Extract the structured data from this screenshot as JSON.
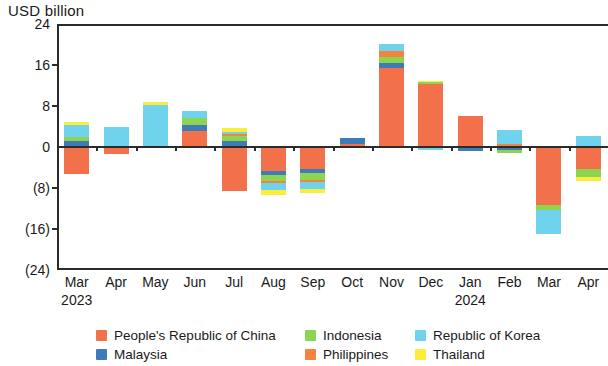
{
  "chart_data": {
    "type": "bar",
    "stacked": true,
    "title": "",
    "subtitle": "",
    "xlabel": "",
    "ylabel": "USD billion",
    "ylim": [
      -24,
      24
    ],
    "yticks": [
      24,
      16,
      8,
      0,
      -8,
      -16,
      -24
    ],
    "ytick_labels": [
      "24",
      "16",
      "8",
      "0",
      "(8)",
      "(16)",
      "(24)"
    ],
    "grid": false,
    "legend_position": "bottom",
    "categories": [
      "Mar",
      "Apr",
      "May",
      "Jun",
      "Jul",
      "Aug",
      "Sep",
      "Oct",
      "Nov",
      "Dec",
      "Jan",
      "Feb",
      "Mar",
      "Apr"
    ],
    "year_labels": [
      {
        "text": "2023",
        "category_index": 0
      },
      {
        "text": "2024",
        "category_index": 10
      }
    ],
    "series": [
      {
        "name": "People's Republic of China",
        "color": "#F2714A",
        "values": [
          -5.2,
          -1.4,
          0.0,
          3.2,
          -8.6,
          -4.6,
          -4.2,
          0.6,
          15.4,
          12.2,
          6.0,
          0.0,
          -11.3,
          -4.2
        ]
      },
      {
        "name": "Malaysia",
        "color": "#3F7CB5",
        "values": [
          1.1,
          0.0,
          0.0,
          1.0,
          1.2,
          -0.9,
          -0.9,
          1.2,
          1.0,
          0.0,
          -0.7,
          -0.5,
          0.0,
          0.0
        ]
      },
      {
        "name": "Indonesia",
        "color": "#8DD450",
        "values": [
          0.9,
          0.0,
          0.0,
          1.4,
          1.0,
          -1.1,
          -1.3,
          0.0,
          1.2,
          0.4,
          0.0,
          -0.7,
          -1.0,
          -1.6
        ]
      },
      {
        "name": "Philippines",
        "color": "#F5823F",
        "values": [
          0.0,
          0.0,
          0.0,
          0.0,
          0.3,
          -0.4,
          -0.4,
          0.0,
          1.1,
          0.0,
          0.0,
          0.5,
          0.0,
          0.0
        ]
      },
      {
        "name": "Republic of Korea",
        "color": "#6FD3EE",
        "values": [
          2.3,
          3.9,
          8.2,
          1.5,
          0.5,
          -1.4,
          -1.4,
          0.0,
          1.4,
          -0.5,
          0.0,
          2.8,
          -4.7,
          2.2
        ]
      },
      {
        "name": "Thailand",
        "color": "#FBEE3B",
        "values": [
          0.6,
          0.0,
          0.5,
          0.0,
          0.7,
          -1.0,
          -0.8,
          0.0,
          0.0,
          0.3,
          0.0,
          0.0,
          0.0,
          -0.9
        ]
      }
    ]
  },
  "legend": {
    "items": [
      {
        "label": "People's Republic of China",
        "color": "#F2714A"
      },
      {
        "label": "Indonesia",
        "color": "#8DD450"
      },
      {
        "label": "Republic of Korea",
        "color": "#6FD3EE"
      },
      {
        "label": "Malaysia",
        "color": "#3F7CB5"
      },
      {
        "label": "Philippines",
        "color": "#F5823F"
      },
      {
        "label": "Thailand",
        "color": "#FBEE3B"
      }
    ]
  }
}
